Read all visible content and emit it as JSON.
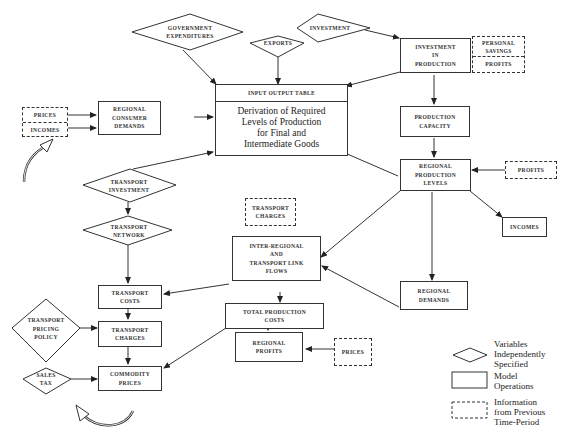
{
  "diagram": {
    "diamonds": {
      "government_expenditures": "GOVERNMENT\nEXPENDITURES",
      "exports": "EXPORTS",
      "investment": "INVESTMENT",
      "transport_investment": "TRANSPORT\nINVESTMENT",
      "transport_network": "TRANSPORT\nNETWORK",
      "transport_pricing_policy": "TRANSPORT\nPRICING\nPOLICY",
      "sales_tax": "SALES\nTAX"
    },
    "boxes": {
      "input_output_table_header": "INPUT OUTPUT TABLE",
      "input_output_table_body": "Derivation of Required\nLevels of Production\nfor Final and\nIntermediate Goods",
      "regional_consumer_demands": "REGIONAL\nCONSUMER\nDEMANDS",
      "investment_in_production": "INVESTMENT\nIN\nPRODUCTION",
      "production_capacity": "PRODUCTION\nCAPACITY",
      "regional_production_levels": "REGIONAL\nPRODUCTION\nLEVELS",
      "incomes": "INCOMES",
      "regional_demands": "REGIONAL\nDEMANDS",
      "inter_regional_flows": "INTER-REGIONAL\nAND\nTRANSPORT LINK\nFLOWS",
      "total_production_costs": "TOTAL PRODUCTION\nCOSTS",
      "regional_profits": "REGIONAL\nPROFITS",
      "transport_costs": "TRANSPORT\nCOSTS",
      "transport_charges": "TRANSPORT\nCHARGES",
      "commodity_prices": "COMMODITY\nPRICES"
    },
    "dashed": {
      "prices_left": "PRICES",
      "incomes_left": "INCOMES",
      "personal_savings": "PERSONAL\nSAVINGS",
      "profits_top": "PROFITS",
      "profits_right": "PROFITS",
      "transport_charges_prev": "TRANSPORT\nCHARGES",
      "prices_bottom": "PRICES"
    }
  },
  "legend": {
    "diamond": "Variables\nIndependently\nSpecified",
    "box": "Model\nOperations",
    "dashed": "Information\nfrom Previous\nTime-Period"
  }
}
